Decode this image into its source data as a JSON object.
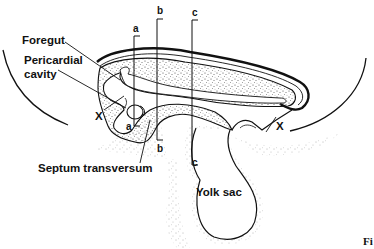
{
  "diagram": {
    "labels": {
      "foregut": "Foregut",
      "pericardial_line1": "Pericardial",
      "pericardial_line2": "cavity",
      "x_left": "X",
      "x_right": "X",
      "septum": "Septum transversum",
      "yolk_sac": "Yolk sac"
    },
    "section_markers": {
      "a_top": "a",
      "a_bottom": "a",
      "b_top": "b",
      "b_bottom": "b",
      "c_top": "c",
      "c_bottom": "c"
    },
    "caption_fragment": "Fi",
    "colors": {
      "ink": "#111111",
      "stipple": "#555555",
      "background": "#ffffff"
    }
  }
}
